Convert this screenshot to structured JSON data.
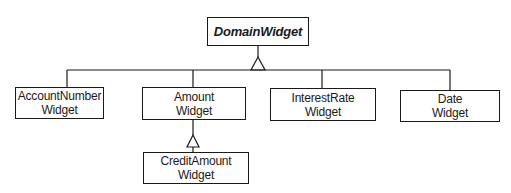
{
  "diagram": {
    "type": "class-hierarchy",
    "root": {
      "id": "domain",
      "label": "DomainWidget",
      "abstract": true
    },
    "classes": [
      {
        "id": "account",
        "lines": [
          "AccountNumber",
          "Widget"
        ],
        "parent": "domain"
      },
      {
        "id": "amount",
        "lines": [
          "Amount",
          "Widget"
        ],
        "parent": "domain"
      },
      {
        "id": "interest",
        "lines": [
          "InterestRate",
          "Widget"
        ],
        "parent": "domain"
      },
      {
        "id": "date",
        "lines": [
          "Date",
          "Widget"
        ],
        "parent": "domain"
      },
      {
        "id": "credit",
        "lines": [
          "CreditAmount",
          "Widget"
        ],
        "parent": "amount"
      }
    ],
    "relationship": "inheritance (hollow triangle)",
    "colors": {
      "line": "#1a1a1a",
      "background": "#ffffff"
    }
  }
}
